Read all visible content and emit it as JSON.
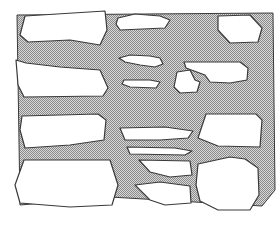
{
  "diagram": {
    "mortar_fill": "#9a9a9a",
    "mortar_pattern_light": "#d8d8d8",
    "stone_fill": "#ffffff",
    "outline": "#3a3a3a",
    "mortar_region": "M17,15 L273,13 L275,190 L262,206 L110,197 L20,205 Z",
    "stones": [
      {
        "id": "top-left-large",
        "d": "M25,16 L105,11 L107,30 L100,45 L70,40 L28,42 L20,35 Z"
      },
      {
        "id": "top-center-small",
        "d": "M118,18 L135,14 L160,16 L170,20 L165,28 L120,30 L116,24 Z"
      },
      {
        "id": "top-right",
        "d": "M218,16 L250,15 L262,28 L258,42 L230,43 L218,30 Z"
      },
      {
        "id": "left-middle",
        "d": "M16,60 L26,63 L60,67 L100,70 L108,88 L103,96 L24,97 L18,85 Z"
      },
      {
        "id": "center-upper-small",
        "d": "M119,58 L130,55 L150,56 L160,58 L163,64 L155,67 L140,65 L125,62 Z"
      },
      {
        "id": "center-upper-thin",
        "d": "M124,80 L150,80 L160,82 L156,88 L130,87 L122,84 Z"
      },
      {
        "id": "center-heart",
        "d": "M177,72 L190,70 L195,80 L200,82 L197,92 L180,93 L174,87 Z"
      },
      {
        "id": "right-upper",
        "d": "M184,62 L240,62 L248,68 L247,80 L230,83 L210,82 L205,75 L186,68 Z"
      },
      {
        "id": "left-lower",
        "d": "M22,116 L98,114 L106,120 L104,140 L70,145 L25,148 L20,130 Z"
      },
      {
        "id": "center-lower-long",
        "d": "M120,128 L165,127 L193,131 L188,138 L160,140 L125,140 Z"
      },
      {
        "id": "center-lower-thin",
        "d": "M127,147 L175,148 L192,151 L185,155 L130,154 Z"
      },
      {
        "id": "right-lower",
        "d": "M206,114 L256,114 L262,120 L260,147 L218,146 L198,138 Z"
      },
      {
        "id": "bottom-left-large",
        "d": "M24,160 L110,160 L118,185 L112,205 L70,207 L20,203 L15,185 Z"
      },
      {
        "id": "bottom-center-upper",
        "d": "M139,160 L190,161 L192,175 L170,177 L150,172 Z"
      },
      {
        "id": "bottom-center-lower",
        "d": "M135,185 L160,182 L190,186 L191,203 L165,205 L150,200 Z"
      },
      {
        "id": "bottom-right-large",
        "d": "M198,164 L230,157 L245,159 L258,168 L259,195 L250,210 L218,210 L200,201 L196,185 Z"
      }
    ]
  }
}
